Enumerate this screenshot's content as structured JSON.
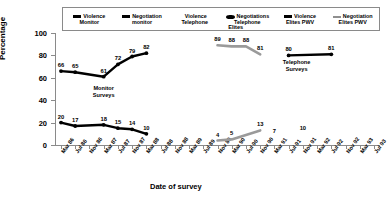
{
  "chart_data": {
    "type": "line",
    "title": "",
    "xlabel": "Date of survey",
    "ylabel": "Percentage",
    "ylim": [
      0,
      100
    ],
    "yticks": [
      0,
      20,
      40,
      60,
      80,
      100
    ],
    "grid": false,
    "legend_position": "top",
    "categories": [
      "Mar 86",
      "Jul 86",
      "Nov 86",
      "Mar 87",
      "Jul 87",
      "Nov 87",
      "Mar 88",
      "Jul 88",
      "Nov 88",
      "Mar 89",
      "Jul 89",
      "Nov 89",
      "Mar 90",
      "Jul 90",
      "Nov 90",
      "Mar 91",
      "Jul 91",
      "Nov 91",
      "Mar 92",
      "Jul 92",
      "Nov 92",
      "Mar 93",
      "Jul 93"
    ],
    "series": [
      {
        "name": "Violence Monitor",
        "color": "#000000",
        "style": "line-marker",
        "x": [
          "Mar 86",
          "Jul 86",
          "Mar 87",
          "Nov 87",
          "Mar 88",
          "Jul 88",
          "Nov 88"
        ],
        "values": [
          66,
          65,
          61,
          72,
          79,
          82,
          null
        ],
        "points": [
          {
            "x": "Mar 86",
            "y": 66,
            "label": "66"
          },
          {
            "x": "Jul 86",
            "y": 65,
            "label": "65"
          },
          {
            "x": "Mar 87",
            "y": 61,
            "label": "61"
          },
          {
            "x": "Jul 87",
            "y": 72,
            "label": "72"
          },
          {
            "x": "Nov 87",
            "y": 79,
            "label": "79"
          },
          {
            "x": "Mar 88",
            "y": 82,
            "label": "82"
          }
        ]
      },
      {
        "name": "Negotiation monitor",
        "color": "#000000",
        "style": "line-marker",
        "points": [
          {
            "x": "Mar 86",
            "y": 20,
            "label": "20"
          },
          {
            "x": "Jul 86",
            "y": 17,
            "label": "17"
          },
          {
            "x": "Mar 87",
            "y": 18,
            "label": "18"
          },
          {
            "x": "Jul 87",
            "y": 15,
            "label": "15"
          },
          {
            "x": "Nov 87",
            "y": 14,
            "label": "14"
          },
          {
            "x": "Mar 88",
            "y": 10,
            "label": "10"
          }
        ]
      },
      {
        "name": "Violence Telephone",
        "color": "#9a9a9a",
        "style": "line-thick",
        "points": [
          {
            "x": "Nov 89",
            "y": 89,
            "label": "89"
          },
          {
            "x": "Mar 90",
            "y": 88,
            "label": "88"
          },
          {
            "x": "Jul 90",
            "y": 88,
            "label": "88"
          },
          {
            "x": "Nov 90",
            "y": 81,
            "label": "81"
          }
        ]
      },
      {
        "name": "Negotiations Telephone",
        "color": "#9a9a9a",
        "style": "line-thick",
        "points": [
          {
            "x": "Nov 89",
            "y": 4,
            "label": "4"
          },
          {
            "x": "Mar 90",
            "y": 5,
            "label": "5"
          },
          {
            "x": "Nov 90",
            "y": 13,
            "label": "13"
          }
        ]
      },
      {
        "name": "Violence Elites PWV",
        "color": "#000000",
        "style": "line-marker",
        "points": [
          {
            "x": "Jul 91",
            "y": 80,
            "label": "80"
          },
          {
            "x": "Jul 92",
            "y": 81,
            "label": "81"
          }
        ]
      },
      {
        "name": "Negotiation Elites PWV",
        "color": "#9a9a9a",
        "style": "scatter-label",
        "points": [
          {
            "x": "Mar 91",
            "y": 7,
            "label": "7"
          },
          {
            "x": "Nov 91",
            "y": 10,
            "label": "10"
          }
        ]
      }
    ],
    "annotations": [
      {
        "name": "monitor-surveys",
        "text_line1": "Monitor",
        "text_line2": "Surveys"
      },
      {
        "name": "elites",
        "text_line1": "Elites",
        "text_line2": ""
      },
      {
        "name": "telephone-surveys",
        "text_line1": "Telephone",
        "text_line2": "Surveys"
      }
    ]
  },
  "legend": {
    "items": [
      {
        "key": "line-black",
        "line1": "Violence",
        "line2": "Monitor"
      },
      {
        "key": "line-black",
        "line1": "Negotiation",
        "line2": "monitor"
      },
      {
        "key": "none",
        "line1": "Violence",
        "line2": "Telephone"
      },
      {
        "key": "marker-black",
        "line1": "Negotiations",
        "line2": "Telephone"
      },
      {
        "key": "line-black",
        "line1": "Violence",
        "line2": "Elites PWV"
      },
      {
        "key": "line-grey",
        "line1": "Negotiation",
        "line2": "Elites PWV"
      }
    ]
  },
  "axes": {
    "ylabel": "Percentage",
    "xlabel": "Date of survey",
    "yticks": [
      "0",
      "20",
      "40",
      "60",
      "80",
      "100"
    ],
    "xticks": [
      "Mar 86",
      "Jul 86",
      "Nov 86",
      "Mar 87",
      "Jul 87",
      "Nov 87",
      "Mar 88",
      "Jul 88",
      "Nov 88",
      "Mar 89",
      "Jul 89",
      "Nov 89",
      "Mar 90",
      "Jul 90",
      "Nov 90",
      "Mar 91",
      "Jul 91",
      "Nov 91",
      "Mar 92",
      "Jul 92",
      "Nov 92",
      "Mar 93",
      "Jul 93"
    ]
  },
  "colors": {
    "series_black": "#000000",
    "series_grey": "#9a9a9a",
    "axis": "#8a8a8a",
    "background": "#ffffff"
  }
}
